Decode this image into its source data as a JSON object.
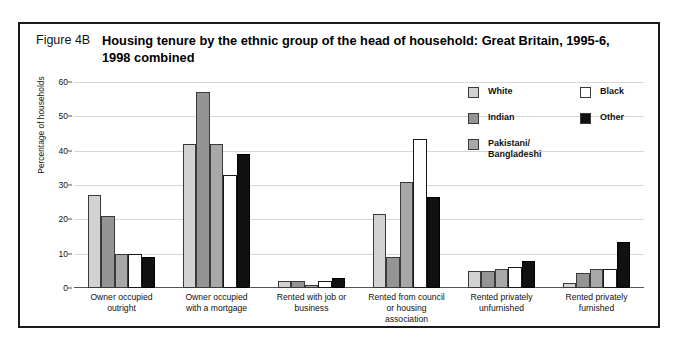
{
  "figure": {
    "number": "Figure 4B",
    "title": "Housing tenure by the ethnic group of the head of household: Great Britain, 1995-6, 1998 combined"
  },
  "legend": {
    "position": "top-right",
    "entries": [
      {
        "label": "White",
        "color": "#d2d2d2"
      },
      {
        "label": "Indian",
        "color": "#949494"
      },
      {
        "label": "Pakistani/\nBangladeshi",
        "color": "#a8a8a8"
      },
      {
        "label": "Black",
        "color": "#ffffff"
      },
      {
        "label": "Other",
        "color": "#111111"
      }
    ]
  },
  "chart_data": {
    "type": "bar",
    "title": "Housing tenure by the ethnic group of the head of household: Great Britain, 1995-6, 1998 combined",
    "xlabel": "",
    "ylabel": "Percentage of households",
    "ylim": [
      0,
      60
    ],
    "yticks": [
      0,
      10,
      20,
      30,
      40,
      50,
      60
    ],
    "grid": true,
    "legend_position": "top-right",
    "categories": [
      "Owner occupied outright",
      "Owner occupied with a mortgage",
      "Rented with job or business",
      "Rented from council or housing association",
      "Rented privately unfurnished",
      "Rented privately furnished"
    ],
    "categories_wrapped": [
      "Owner occupied\noutright",
      "Owner occupied\nwith a mortgage",
      "Rented with job or\nbusiness",
      "Rented from council\nor housing\nassociation",
      "Rented privately\nunfurnished",
      "Rented privately\nfurnished"
    ],
    "series": [
      {
        "name": "White",
        "color": "#d2d2d2",
        "values": [
          27,
          42,
          2,
          21.5,
          5,
          1.5
        ]
      },
      {
        "name": "Indian",
        "color": "#949494",
        "values": [
          21,
          57,
          2,
          9,
          5,
          4.5
        ]
      },
      {
        "name": "Pakistani/Bangladeshi",
        "color": "#a8a8a8",
        "values": [
          10,
          42,
          1,
          31,
          5.5,
          5.5
        ]
      },
      {
        "name": "Black",
        "color": "#ffffff",
        "values": [
          10,
          33,
          2,
          43.5,
          6,
          5.5
        ]
      },
      {
        "name": "Other",
        "color": "#111111",
        "values": [
          9,
          39,
          3,
          26.5,
          8,
          13.5
        ]
      }
    ]
  }
}
